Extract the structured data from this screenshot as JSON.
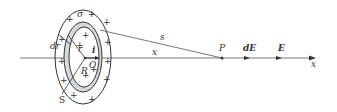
{
  "figure": {
    "labels": {
      "sigma": "σ",
      "dr": "dr",
      "r": "r",
      "i": "i",
      "O": "O",
      "R": "R",
      "S": "S",
      "s": "s",
      "x_dist": "x",
      "P": "P",
      "dE": "dE",
      "E": "E",
      "x_axis": "x"
    },
    "plus_sign": "+",
    "colors": {
      "stroke": "#333333",
      "ring_fill": "#bbbbbb"
    }
  }
}
